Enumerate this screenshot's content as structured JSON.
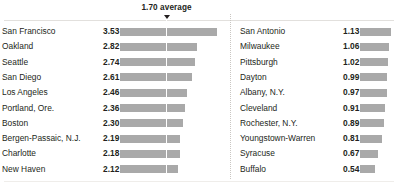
{
  "chart_data": {
    "type": "bar",
    "title": "",
    "xlabel": "",
    "ylabel": "",
    "grid": false,
    "legend": "none",
    "orientation": "horizontal",
    "xlim": [
      0,
      3.53
    ],
    "value_precision": 2,
    "average": {
      "value": 1.7,
      "label": "1.70 average",
      "marker": "down-triangle"
    },
    "panels": [
      {
        "name": "left-panel",
        "categories": [
          "San Francisco",
          "Oakland",
          "Seattle",
          "San Diego",
          "Los Angeles",
          "Portland, Ore.",
          "Boston",
          "Bergen-Passaic, N.J.",
          "Charlotte",
          "New Haven"
        ],
        "values": [
          3.53,
          2.82,
          2.74,
          2.61,
          2.46,
          2.36,
          2.3,
          2.19,
          2.18,
          2.12
        ],
        "value_labels": [
          "3.53",
          "2.82",
          "2.74",
          "2.61",
          "2.46",
          "2.36",
          "2.30",
          "2.19",
          "2.18",
          "2.12"
        ]
      },
      {
        "name": "right-panel",
        "categories": [
          "San Antonio",
          "Milwaukee",
          "Pittsburgh",
          "Dayton",
          "Albany, N.Y.",
          "Cleveland",
          "Rochester, N.Y.",
          "Youngstown-Warren",
          "Syracuse",
          "Buffalo"
        ],
        "values": [
          1.13,
          1.06,
          1.02,
          0.99,
          0.97,
          0.91,
          0.89,
          0.81,
          0.67,
          0.54
        ],
        "value_labels": [
          "1.13",
          "1.06",
          "1.02",
          "0.99",
          "0.97",
          "0.91",
          "0.89",
          "0.81",
          "0.67",
          "0.54"
        ]
      }
    ],
    "colors": {
      "bar": "#a9a9a9",
      "text": "#231f20",
      "rule": "#e2e0dd",
      "divider": "#c9c6c2",
      "background": "#ffffff"
    }
  }
}
